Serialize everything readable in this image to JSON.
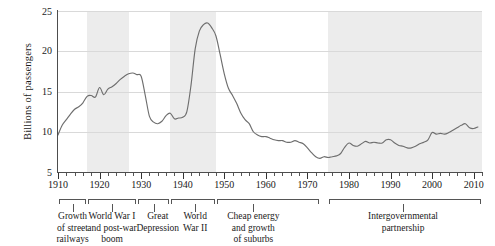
{
  "chart_data": {
    "type": "line",
    "title": "",
    "xlabel": "",
    "ylabel": "Billions of passengers",
    "xlim": [
      1910,
      2012
    ],
    "ylim": [
      5,
      25
    ],
    "grid": true,
    "legend": "none",
    "ytick_labels": [
      "25",
      "20",
      "15",
      "10",
      "5"
    ],
    "yticks": [
      25,
      20,
      15,
      10,
      5
    ],
    "xtick_labels": [
      "1910",
      "1920",
      "1930",
      "1940",
      "1950",
      "1960",
      "1970",
      "1980",
      "1990",
      "2000",
      "2010"
    ],
    "xticks": [
      1910,
      1920,
      1930,
      1940,
      1950,
      1960,
      1970,
      1980,
      1990,
      2000,
      2010
    ],
    "minor_xtick_interval": 2,
    "series_name": "Transit passengers",
    "series_color": "#6e6e6e",
    "shaded_band_color": "#ececec",
    "shaded_bands": [
      {
        "label": "World War I and post-war boom",
        "start": 1917,
        "end": 1927
      },
      {
        "label": "World War II",
        "start": 1937,
        "end": 1948
      },
      {
        "label": "Intergovernmental partnership",
        "start": 1975,
        "end": 2012
      }
    ],
    "x": [
      1910,
      1911,
      1912,
      1913,
      1914,
      1915,
      1916,
      1917,
      1918,
      1919,
      1920,
      1921,
      1922,
      1923,
      1924,
      1925,
      1926,
      1927,
      1928,
      1929,
      1930,
      1931,
      1932,
      1933,
      1934,
      1935,
      1936,
      1937,
      1938,
      1939,
      1940,
      1941,
      1942,
      1943,
      1944,
      1945,
      1946,
      1947,
      1948,
      1949,
      1950,
      1951,
      1952,
      1953,
      1954,
      1955,
      1956,
      1957,
      1958,
      1959,
      1960,
      1961,
      1962,
      1963,
      1964,
      1965,
      1966,
      1967,
      1968,
      1969,
      1970,
      1971,
      1972,
      1973,
      1974,
      1975,
      1976,
      1977,
      1978,
      1979,
      1980,
      1981,
      1982,
      1983,
      1984,
      1985,
      1986,
      1987,
      1988,
      1989,
      1990,
      1991,
      1992,
      1993,
      1994,
      1995,
      1996,
      1997,
      1998,
      1999,
      2000,
      2001,
      2002,
      2003,
      2004,
      2005,
      2006,
      2007,
      2008,
      2009,
      2010,
      2011
    ],
    "values": [
      9.6,
      10.8,
      11.5,
      12.2,
      12.8,
      13.1,
      13.6,
      14.4,
      14.5,
      14.3,
      15.5,
      14.6,
      15.3,
      15.6,
      16.0,
      16.5,
      16.9,
      17.2,
      17.3,
      17.1,
      16.9,
      14.5,
      11.9,
      11.2,
      11.0,
      11.3,
      12.0,
      12.3,
      11.6,
      11.7,
      11.8,
      12.5,
      15.8,
      20.3,
      22.5,
      23.3,
      23.5,
      22.9,
      21.9,
      19.6,
      17.2,
      15.4,
      14.5,
      13.5,
      12.3,
      11.5,
      11.0,
      10.0,
      9.6,
      9.4,
      9.4,
      9.2,
      9.0,
      8.9,
      8.9,
      8.7,
      8.7,
      8.9,
      8.7,
      8.5,
      8.0,
      7.4,
      6.9,
      6.7,
      6.9,
      6.8,
      6.9,
      7.0,
      7.3,
      8.1,
      8.6,
      8.3,
      8.2,
      8.5,
      8.8,
      8.6,
      8.7,
      8.6,
      8.6,
      9.0,
      9.0,
      8.6,
      8.3,
      8.2,
      8.0,
      8.0,
      8.2,
      8.5,
      8.7,
      9.0,
      9.9,
      9.7,
      9.8,
      9.7,
      9.9,
      10.2,
      10.5,
      10.8,
      11.0,
      10.5,
      10.4,
      10.6
    ]
  },
  "period_annotations": [
    {
      "name": "growth-of-street-railways",
      "lines": [
        "Growth",
        "of street",
        "railways"
      ]
    },
    {
      "name": "world-war-i-and-post-war-boom",
      "lines": [
        "World War I",
        "and post-war",
        "boom"
      ]
    },
    {
      "name": "great-depression",
      "lines": [
        "Great",
        "Depression"
      ]
    },
    {
      "name": "world-war-ii",
      "lines": [
        "World",
        "War II"
      ]
    },
    {
      "name": "cheap-energy-and-growth-of-suburbs",
      "lines": [
        "Cheap energy",
        "and growth",
        "of suburbs"
      ]
    },
    {
      "name": "intergovernmental-partnership",
      "lines": [
        "Intergovernmental",
        "partnership"
      ]
    }
  ]
}
